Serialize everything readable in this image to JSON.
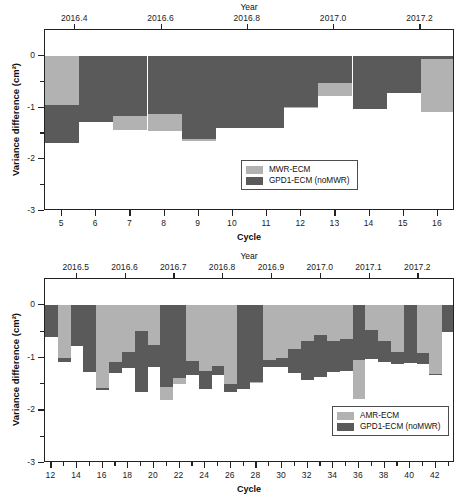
{
  "figure": {
    "background": "#ffffff",
    "series_colors": {
      "light": "#b2b2b2",
      "dark": "#5a5a5a"
    }
  },
  "chart_data": [
    {
      "id": "top",
      "type": "bar",
      "title": "",
      "xlabel": "Cycle",
      "ylabel": "Variance difference (cm²)",
      "top_axis_label": "Year",
      "ylim": [
        -3,
        0.5
      ],
      "yticks": [
        0,
        -1,
        -2,
        -3
      ],
      "ytick_labels": [
        "0",
        "-1",
        "-2",
        "-3"
      ],
      "yminor": [
        -0.5,
        -1.5,
        -2.5
      ],
      "xlim": [
        4.5,
        16.5
      ],
      "xticks": [
        5,
        6,
        7,
        8,
        9,
        10,
        11,
        12,
        13,
        14,
        15,
        16
      ],
      "xtick_labels": [
        "5",
        "6",
        "7",
        "8",
        "9",
        "10",
        "11",
        "12",
        "13",
        "14",
        "15",
        "16"
      ],
      "top_xlim": [
        2016.33,
        2017.28
      ],
      "top_xticks": [
        2016.4,
        2016.6,
        2016.8,
        2017.0,
        2017.2
      ],
      "top_xtick_labels": [
        "2016.4",
        "2016.6",
        "2016.8",
        "2017.0",
        "2017.2"
      ],
      "grid": false,
      "legend_position": "lower right",
      "categories": [
        5,
        6,
        7,
        8,
        9,
        10,
        11,
        12,
        13,
        14,
        15,
        16
      ],
      "series": [
        {
          "name": "MWR-ECM",
          "color": "#b2b2b2",
          "values": [
            -0.95,
            -1.28,
            -1.44,
            -1.45,
            -1.65,
            -1.4,
            -1.4,
            -1.0,
            -0.77,
            -1.03,
            -0.71,
            -1.09
          ]
        },
        {
          "name": "GPD1-ECM (noMWR)",
          "color": "#5a5a5a",
          "values": [
            -1.68,
            -1.28,
            -1.17,
            -1.12,
            -1.6,
            -1.4,
            -1.4,
            -0.98,
            -0.53,
            -1.03,
            -0.71,
            -0.07
          ]
        }
      ]
    },
    {
      "id": "bottom",
      "type": "bar",
      "title": "",
      "xlabel": "Cycle",
      "ylabel": "Variance difference (cm²)",
      "top_axis_label": "Year",
      "ylim": [
        -3,
        0.5
      ],
      "yticks": [
        0,
        -1,
        -2,
        -3
      ],
      "ytick_labels": [
        "0",
        "-1",
        "-2",
        "-3"
      ],
      "yminor": [
        -0.5,
        -1.5,
        -2.5
      ],
      "xlim": [
        11.5,
        43.5
      ],
      "xticks": [
        12,
        14,
        16,
        18,
        20,
        22,
        24,
        26,
        28,
        30,
        32,
        34,
        36,
        38,
        40,
        42
      ],
      "xtick_labels": [
        "12",
        "14",
        "16",
        "18",
        "20",
        "22",
        "24",
        "26",
        "28",
        "30",
        "32",
        "34",
        "36",
        "38",
        "40",
        "42"
      ],
      "xticks_minor": [
        13,
        15,
        17,
        19,
        21,
        23,
        25,
        27,
        29,
        31,
        33,
        35,
        37,
        39,
        41,
        43
      ],
      "top_xlim": [
        2016.435,
        2017.275
      ],
      "top_xticks": [
        2016.5,
        2016.6,
        2016.7,
        2016.8,
        2016.9,
        2017.0,
        2017.1,
        2017.2
      ],
      "top_xtick_labels": [
        "2016.5",
        "2016.6",
        "2016.7",
        "2016.8",
        "2016.9",
        "2017.0",
        "2017.1",
        "2017.2"
      ],
      "grid": false,
      "legend_position": "lower right",
      "categories": [
        12,
        13,
        14,
        15,
        16,
        17,
        18,
        19,
        20,
        21,
        22,
        23,
        24,
        25,
        26,
        27,
        28,
        29,
        30,
        31,
        32,
        33,
        34,
        35,
        36,
        37,
        38,
        39,
        40,
        41,
        42,
        43
      ],
      "series": [
        {
          "name": "AMR-ECM",
          "color": "#b2b2b2",
          "values": [
            -0.6,
            -1.0,
            -0.78,
            -1.27,
            -1.58,
            -1.08,
            -0.88,
            -0.49,
            -0.76,
            -1.8,
            -1.5,
            -1.06,
            -1.25,
            -1.15,
            -1.5,
            -1.6,
            -1.47,
            -1.05,
            -1.0,
            -0.83,
            -0.68,
            -0.57,
            -0.67,
            -0.65,
            -1.78,
            -0.47,
            -0.67,
            -0.88,
            -1.1,
            -0.9,
            -1.3,
            -0.5
          ]
        },
        {
          "name": "GPD1-ECM (noMWR)",
          "color": "#5a5a5a",
          "values": [
            -0.6,
            -1.08,
            -0.78,
            -1.27,
            -1.62,
            -1.28,
            -1.2,
            -1.65,
            -1.17,
            -1.55,
            -1.38,
            -1.32,
            -1.6,
            -1.32,
            -1.65,
            -1.6,
            -1.45,
            -1.17,
            -1.17,
            -1.28,
            -1.42,
            -1.37,
            -1.27,
            -1.25,
            -1.05,
            -1.02,
            -1.08,
            -1.12,
            -1.1,
            -1.12,
            -1.33,
            -0.5
          ]
        }
      ]
    }
  ],
  "legends": [
    {
      "id": "top",
      "items": [
        {
          "label": "MWR-ECM",
          "color": "#b2b2b2"
        },
        {
          "label": "GPD1-ECM (noMWR)",
          "color": "#5a5a5a"
        }
      ]
    },
    {
      "id": "bottom",
      "items": [
        {
          "label": "AMR-ECM",
          "color": "#b2b2b2"
        },
        {
          "label": "GPD1-ECM (noMWR)",
          "color": "#5a5a5a"
        }
      ]
    }
  ]
}
